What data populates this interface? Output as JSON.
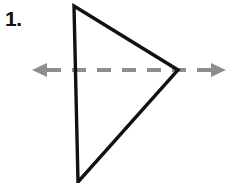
{
  "figure": {
    "problem_number": "1.",
    "background_color": "#ffffff",
    "width": 229,
    "height": 183,
    "description_labels": {
      "shape_name": "triangle",
      "axis_name": "line-of-symmetry"
    }
  },
  "shape": {
    "name": "triangle",
    "stroke_color": "#111111",
    "stroke_width": 3.4,
    "fill": "none",
    "vertices": [
      {
        "label": "top-vertex",
        "x": 74,
        "y": 6
      },
      {
        "label": "right-vertex",
        "x": 178,
        "y": 70
      },
      {
        "label": "bottom-vertex",
        "x": 78,
        "y": 182
      }
    ],
    "points_attribute": "74,6 178,70 78,182"
  },
  "axis": {
    "name": "line-of-symmetry",
    "style": "dashed",
    "color": "#8d8d8d",
    "stroke_width": 4,
    "dash_pattern": "14 11",
    "y": 70,
    "x_start": 33,
    "x_end": 226,
    "arrowheads": [
      {
        "label": "left-arrowhead",
        "direction": "left",
        "tip_x": 32,
        "tip_y": 70
      },
      {
        "label": "right-arrowhead",
        "direction": "right",
        "tip_x": 226,
        "tip_y": 70
      }
    ],
    "left_arrow_points": "32,70 47,63 47,77",
    "right_arrow_points": "226,70 211,63 211,77",
    "segment_start_x": 47,
    "segment_end_x": 211
  },
  "colors": {
    "ink": "#111111",
    "gray_axis": "#8d8d8d",
    "background": "#ffffff"
  }
}
